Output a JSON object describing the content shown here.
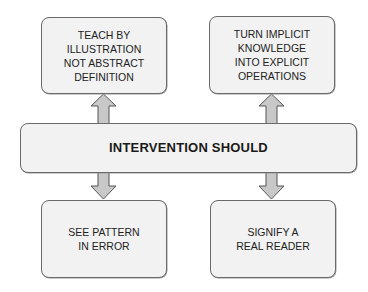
{
  "diagram": {
    "center": {
      "label": "INTERVENTION SHOULD"
    },
    "top_left": {
      "lines": [
        "TEACH BY",
        "ILLUSTRATION",
        "NOT ABSTRACT",
        "DEFINITION"
      ]
    },
    "top_right": {
      "lines": [
        "TURN IMPLICIT",
        "KNOWLEDGE",
        "INTO EXPLICIT",
        "OPERATIONS"
      ]
    },
    "bottom_left": {
      "lines": [
        "SEE PATTERN",
        "IN ERROR"
      ]
    },
    "bottom_right": {
      "lines": [
        "SIGNIFY A",
        "REAL READER"
      ]
    },
    "arrows": [
      {
        "from": "center",
        "to": "top_left",
        "direction": "up"
      },
      {
        "from": "center",
        "to": "top_right",
        "direction": "up"
      },
      {
        "from": "center",
        "to": "bottom_left",
        "direction": "down"
      },
      {
        "from": "center",
        "to": "bottom_right",
        "direction": "down"
      }
    ],
    "colors": {
      "box_fill": "#f2f2f2",
      "box_border": "#6a6a6a",
      "arrow_fill": "#c8c8c8",
      "arrow_stroke": "#555555"
    }
  }
}
